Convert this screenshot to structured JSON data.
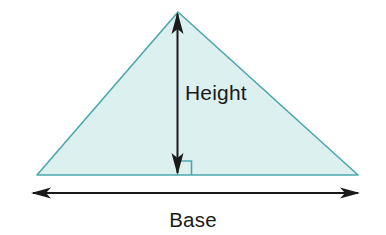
{
  "figure": {
    "name": "triangle-base-height-diagram",
    "background_color": "#ffffff",
    "width": 386,
    "height": 235
  },
  "shape": {
    "name": "triangle",
    "fill_color": "#ddf0f0",
    "stroke_color": "#4aa8ad",
    "stroke_width": 1.6,
    "points": "178,12 358,175 37,175",
    "apex": {
      "x": 178,
      "y": 12
    },
    "left_vertex": {
      "x": 37,
      "y": 175
    },
    "right_vertex": {
      "x": 358,
      "y": 175
    }
  },
  "height_annotation": {
    "label": "Height",
    "label_x": 185,
    "label_y": 100,
    "line_color": "#1a1a1a",
    "line_width": 2,
    "stem_x": 177.5,
    "top_y": 12,
    "bottom_y": 175,
    "arrow_head_half_width": 6,
    "arrow_head_length": 22
  },
  "right_angle_marker": {
    "label": "right-angle-marker",
    "stroke_color": "#4aa8ad",
    "stroke_width": 1.6,
    "path": "M 177.5 161 L 191.5 161 L 191.5 175"
  },
  "base_annotation": {
    "label": "Base",
    "label_x": 193,
    "label_y": 227,
    "line_color": "#1a1a1a",
    "line_width": 1.8,
    "y": 193,
    "left_x": 31,
    "right_x": 360,
    "arrow_head_half_width": 5.5,
    "arrow_head_length": 20
  }
}
